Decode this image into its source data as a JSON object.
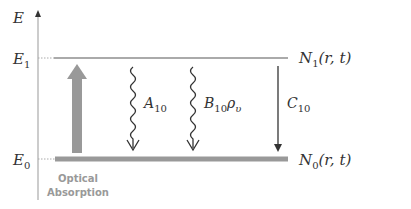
{
  "axis": {
    "label": "E"
  },
  "levels": {
    "upper": {
      "energy_label": "E",
      "energy_sub": "1",
      "population_label": "N",
      "population_sub": "1",
      "population_args": "(r, t)"
    },
    "lower": {
      "energy_label": "E",
      "energy_sub": "0",
      "population_label": "N",
      "population_sub": "0",
      "population_args": "(r, t)"
    }
  },
  "transitions": {
    "absorption": {
      "label_line1": "Optical",
      "label_line2": "Absorption"
    },
    "spontaneous": {
      "symbol": "A",
      "sub": "10"
    },
    "stimulated": {
      "symbol": "B",
      "sub": "10",
      "factor": "ρ",
      "factor_sub": "υ"
    },
    "collisional": {
      "symbol": "C",
      "sub": "10"
    }
  },
  "colors": {
    "level_line": "#aaaaaa",
    "absorption_arrow": "#999999",
    "arrow": "#333333",
    "axis": "#999999"
  }
}
